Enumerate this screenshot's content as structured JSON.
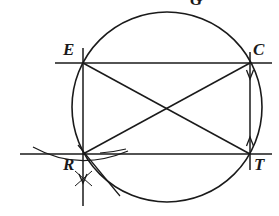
{
  "figure": {
    "kind": "geometric-construction",
    "background_color": "#ffffff",
    "stroke_color": "#1a1a1a",
    "labels": {
      "E": "E",
      "C": "C",
      "R": "R",
      "T": "T",
      "top_clipped": "G"
    },
    "circle": {
      "center_x": 167,
      "center_y": 107,
      "radius": 95
    },
    "vertices": {
      "E": {
        "x": 83,
        "y": 63
      },
      "C": {
        "x": 250,
        "y": 63
      },
      "R": {
        "x": 83,
        "y": 154
      },
      "T": {
        "x": 250,
        "y": 154
      }
    },
    "lines": {
      "top_horizontal": {
        "x1": 55,
        "y1": 63,
        "x2": 272,
        "y2": 63
      },
      "bottom_horizontal": {
        "x1": 20,
        "y1": 154,
        "x2": 272,
        "y2": 154
      },
      "left_vertical": {
        "x1": 83,
        "y1": 48,
        "x2": 83,
        "y2": 205
      },
      "right_vertical": {
        "x1": 250,
        "y1": 52,
        "x2": 250,
        "y2": 170
      },
      "diagonal_e_to_t": {
        "x1": 83,
        "y1": 63,
        "x2": 250,
        "y2": 154
      },
      "diagonal_r_to_c": {
        "x1": 83,
        "y1": 154,
        "x2": 250,
        "y2": 63
      }
    },
    "arrow_marks": [
      {
        "name": "arrow-down-below-R",
        "x": 83,
        "y": 182
      },
      {
        "name": "arrow-down-at-C",
        "x": 250,
        "y": 78
      },
      {
        "name": "arrow-up-at-T",
        "x": 250,
        "y": 138
      }
    ],
    "construction_arcs": [
      {
        "name": "arc-through-R-upper",
        "note": "shallow arc crossing bottom line near R"
      },
      {
        "name": "arc-through-R-lower",
        "note": "shallow arc crossing below R forming X mark"
      },
      {
        "name": "arc-left-tick",
        "note": "short tick arc left of R on bottom line"
      }
    ]
  }
}
